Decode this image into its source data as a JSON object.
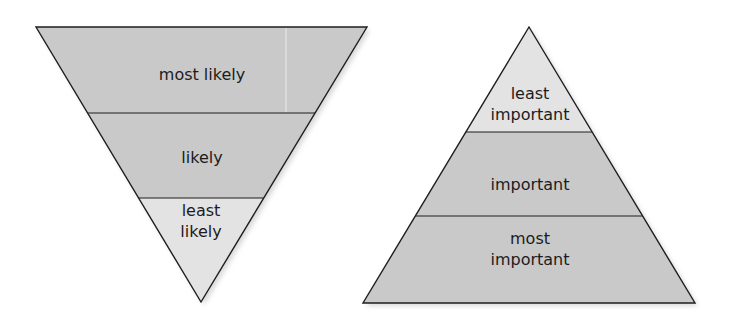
{
  "colors": {
    "background": "#ffffff",
    "band_dark": "#c9c9c9",
    "band_light": "#e3e3e3",
    "outline": "#1e1e1e",
    "text": "#1c1c1c",
    "shadow": "#d6d6d6"
  },
  "inverted_pyramid": {
    "title": "Inverted pyramid (likelihood)",
    "vertices": {
      "top_left": [
        36,
        27
      ],
      "top_right": [
        367,
        27
      ],
      "bottom": [
        201,
        302
      ]
    },
    "dividers_y": [
      113,
      198
    ],
    "bands": [
      {
        "label_line1": "most likely",
        "label_line2": "",
        "shade": "dark"
      },
      {
        "label_line1": "likely",
        "label_line2": "",
        "shade": "dark"
      },
      {
        "label_line1": "least",
        "label_line2": "likely",
        "shade": "light"
      }
    ]
  },
  "pyramid": {
    "title": "Pyramid (importance)",
    "vertices": {
      "apex": [
        529,
        27
      ],
      "bottom_left": [
        363,
        303
      ],
      "bottom_right": [
        695,
        303
      ]
    },
    "dividers_y": [
      132,
      216
    ],
    "bands": [
      {
        "label_line1": "least",
        "label_line2": "important",
        "shade": "light"
      },
      {
        "label_line1": "important",
        "label_line2": "",
        "shade": "dark"
      },
      {
        "label_line1": "most",
        "label_line2": "important",
        "shade": "dark"
      }
    ]
  }
}
